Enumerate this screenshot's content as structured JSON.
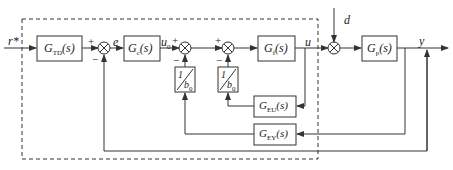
{
  "diagram": {
    "type": "control-block-diagram",
    "signals": {
      "reference": "r*",
      "error": "e",
      "control_nominal": "u",
      "control_nominal_sub": "0",
      "control": "u",
      "disturbance": "d",
      "output": "y"
    },
    "blocks": [
      {
        "id": "td",
        "name": "G",
        "sub": "TD",
        "arg": "(s)"
      },
      {
        "id": "c",
        "name": "G",
        "sub": "c",
        "arg": "(s)"
      },
      {
        "id": "f",
        "name": "G",
        "sub": "f",
        "arg": "(s)"
      },
      {
        "id": "p",
        "name": "G",
        "sub": "p",
        "arg": "(s)"
      },
      {
        "id": "eu",
        "name": "G",
        "sub": "EU",
        "arg": "(s)"
      },
      {
        "id": "ey",
        "name": "G",
        "sub": "EY",
        "arg": "(s)"
      },
      {
        "id": "b1",
        "num": "1",
        "den": "b",
        "den_sub": "0"
      },
      {
        "id": "b2",
        "num": "1",
        "den": "b",
        "den_sub": "0"
      }
    ],
    "signs": {
      "plus": "+",
      "minus": "−"
    },
    "edges": [
      "r* -> G_TD",
      "G_TD -> sum1(+)",
      "sum1 -> e -> G_c",
      "G_c -> u0 -> sum2(+)",
      "sum2 -> sum3(+)",
      "sum3 -> G_f",
      "G_f -> u -> sum4",
      "d -> sum4",
      "sum4 -> G_p",
      "G_p -> y",
      "u -> G_EU",
      "G_EU -> 1/b0 -> sum3(−)",
      "y -> G_EY",
      "G_EY -> 1/b0 -> sum2(−)",
      "y -> sum1(−)"
    ]
  }
}
